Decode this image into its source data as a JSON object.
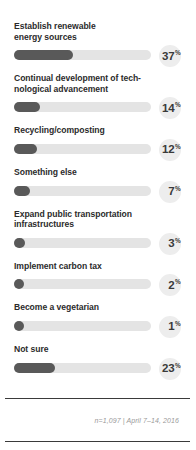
{
  "chart_data": {
    "type": "bar",
    "title": "",
    "subtitle": "",
    "xlabel": "",
    "ylabel": "",
    "orientation": "horizontal",
    "grid": false,
    "legend": null,
    "value_suffix": "%",
    "xlim": [
      0,
      100
    ],
    "categories": [
      "Establish renewable\nenergy sources",
      "Continual development of tech-\nnological advancement",
      "Recycling/composting",
      "Something else",
      "Expand public transportation\ninfrastructures",
      "Implement carbon tax",
      "Become a vegetarian",
      "Not sure"
    ],
    "values": [
      37,
      14,
      12,
      7,
      3,
      2,
      1,
      23
    ],
    "bars": [
      {
        "label": "Establish renewable\nenergy sources",
        "value": 37,
        "value_text": "37",
        "suffix": "%",
        "fill_width": "43%"
      },
      {
        "label": "Continual development of tech-\nnological advancement",
        "value": 14,
        "value_text": "14",
        "suffix": "%",
        "fill_width": "19%"
      },
      {
        "label": "Recycling/composting",
        "value": 12,
        "value_text": "12",
        "suffix": "%",
        "fill_width": "17%"
      },
      {
        "label": "Something else",
        "value": 7,
        "value_text": "7",
        "suffix": "%",
        "fill_width": "12%"
      },
      {
        "label": "Expand public transportation\ninfrastructures",
        "value": 3,
        "value_text": "3",
        "suffix": "%",
        "fill_width": "8%"
      },
      {
        "label": "Implement carbon tax",
        "value": 2,
        "value_text": "2",
        "suffix": "%",
        "fill_width": "7.5%"
      },
      {
        "label": "Become a vegetarian",
        "value": 1,
        "value_text": "1",
        "suffix": "%",
        "fill_width": "7%"
      },
      {
        "label": "Not sure",
        "value": 23,
        "value_text": "23",
        "suffix": "%",
        "fill_width": "30%"
      }
    ],
    "annotations": [
      "n=1,097 | April 7–14, 2016"
    ],
    "colors": {
      "bar_fill": "#595959",
      "bar_track": "#e4e4e4",
      "value_badge": "#ededed",
      "label_text": "#2b2b2b",
      "value_text": "#3a3a3a",
      "footnote_text": "#9a9a9a",
      "card_background": "#ffffff",
      "rule": "#3a3a3a"
    }
  },
  "footer": {
    "note": "n=1,097 | April 7–14, 2016"
  }
}
